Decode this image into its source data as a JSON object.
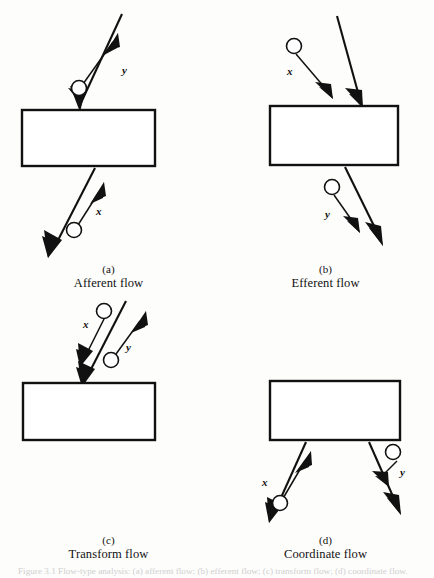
{
  "figure": {
    "type": "textbook-figure",
    "caption_footer": "Figure 3.1  Flow-type analysis: (a) afferent flow; (b) efferent flow; (c) transform flow; (d) coordinate flow.",
    "panels": [
      {
        "id": "a",
        "letter": "(a)",
        "title": "Afferent flow",
        "box": {
          "x": 22,
          "y": 110,
          "width": 133,
          "height": 56
        },
        "labels": [
          {
            "name": "y",
            "text": "y",
            "x": 122,
            "y": 70
          },
          {
            "name": "x",
            "text": "x",
            "x": 98,
            "y": 211
          }
        ],
        "nodes": [
          {
            "name": "node-y",
            "cx": 79,
            "cy": 88,
            "r": 7.5
          },
          {
            "name": "node-x",
            "cx": 74,
            "cy": 230,
            "r": 7.5
          }
        ]
      },
      {
        "id": "b",
        "letter": "(b)",
        "title": "Efferent flow",
        "box": {
          "x": 270,
          "y": 106,
          "width": 128,
          "height": 59
        },
        "labels": [
          {
            "name": "x",
            "text": "x",
            "x": 289,
            "y": 71
          },
          {
            "name": "y",
            "text": "y",
            "x": 329,
            "y": 214
          }
        ],
        "nodes": [
          {
            "name": "node-x",
            "cx": 294,
            "cy": 46,
            "r": 7.5
          },
          {
            "name": "node-y",
            "cx": 332,
            "cy": 187,
            "r": 7.5
          }
        ]
      },
      {
        "id": "c",
        "letter": "(c)",
        "title": "Transform flow",
        "box": {
          "x": 23,
          "y": 383,
          "width": 132,
          "height": 57
        },
        "labels": [
          {
            "name": "x",
            "text": "x",
            "x": 85,
            "y": 325
          },
          {
            "name": "y",
            "text": "y",
            "x": 128,
            "y": 347
          }
        ],
        "nodes": [
          {
            "name": "node-x",
            "cx": 104,
            "cy": 311,
            "r": 7.5
          },
          {
            "name": "node-y",
            "cx": 111,
            "cy": 360,
            "r": 7.5
          }
        ]
      },
      {
        "id": "d",
        "letter": "(d)",
        "title": "Coordinate flow",
        "box": {
          "x": 270,
          "y": 381,
          "width": 130,
          "height": 59
        },
        "labels": [
          {
            "name": "x",
            "text": "x",
            "x": 287,
            "y": 482
          },
          {
            "name": "y",
            "text": "y",
            "x": 392,
            "y": 472
          }
        ],
        "nodes": [
          {
            "name": "node-x",
            "cx": 280,
            "cy": 503,
            "r": 7.5
          },
          {
            "name": "node-y",
            "cx": 393,
            "cy": 452,
            "r": 7.5
          }
        ]
      }
    ]
  },
  "colors": {
    "ink": "#111111",
    "paper": "#fdfdfc",
    "faded_caption": "#cfcfcf"
  }
}
